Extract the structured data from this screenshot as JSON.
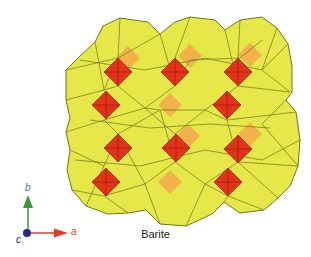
{
  "figure": {
    "caption": "Barite",
    "colors": {
      "polyhedra_fill": "#e6e84a",
      "polyhedra_edge": "#6b7a1e",
      "tetrahedra_front": "#e2321a",
      "tetrahedra_back": "#f4a84a",
      "axis_a": "#e03a2a",
      "axis_b": "#3a9a3a",
      "axis_c": "#1a2a8a"
    },
    "axes": {
      "a_label": "a",
      "b_label": "b",
      "c_label": "c"
    },
    "tetrahedra_front": [
      {
        "cx": 118,
        "cy": 72
      },
      {
        "cx": 106,
        "cy": 105
      },
      {
        "cx": 175,
        "cy": 72
      },
      {
        "cx": 238,
        "cy": 72
      },
      {
        "cx": 227,
        "cy": 105
      },
      {
        "cx": 118,
        "cy": 148
      },
      {
        "cx": 106,
        "cy": 182
      },
      {
        "cx": 176,
        "cy": 148
      },
      {
        "cx": 238,
        "cy": 149
      },
      {
        "cx": 228,
        "cy": 182
      }
    ],
    "tetrahedra_back": [
      {
        "cx": 128,
        "cy": 58
      },
      {
        "cx": 190,
        "cy": 56
      },
      {
        "cx": 250,
        "cy": 55
      },
      {
        "cx": 170,
        "cy": 105
      },
      {
        "cx": 170,
        "cy": 182
      },
      {
        "cx": 188,
        "cy": 136
      },
      {
        "cx": 250,
        "cy": 134
      }
    ]
  }
}
